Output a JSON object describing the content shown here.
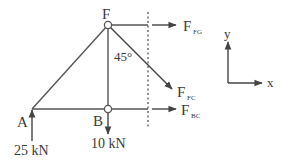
{
  "diagram": {
    "type": "truss-free-body-section",
    "colors": {
      "line": "#555555",
      "text": "#3a3a3a",
      "background": "#ffffff"
    },
    "joints": {
      "F": {
        "label": "F"
      },
      "B": {
        "label": "B"
      },
      "A": {
        "label": "A"
      }
    },
    "angle_label": "45°",
    "forces": {
      "fg": {
        "main": "F",
        "sub": "FG"
      },
      "fc": {
        "main": "F",
        "sub": "FC"
      },
      "bc": {
        "main": "F",
        "sub": "BC"
      }
    },
    "loads": {
      "reaction_a": "25 kN",
      "load_b": "10 kN"
    },
    "axes": {
      "x_label": "x",
      "y_label": "y"
    }
  }
}
